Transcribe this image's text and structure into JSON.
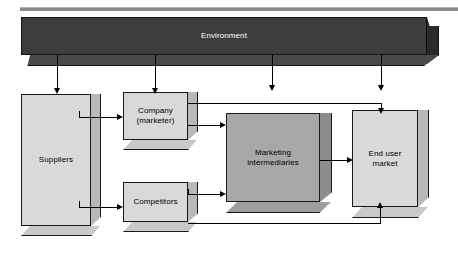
{
  "diagram": {
    "title_label": "Environment",
    "nodes": [
      {
        "id": "environment",
        "label": "Environment",
        "shade": "dark",
        "text_color": "#ffffff"
      },
      {
        "id": "suppliers",
        "label": "Suppliers",
        "shade": "light",
        "text_color": "#000000"
      },
      {
        "id": "company",
        "label": "Company\n(marketer)",
        "shade": "light",
        "text_color": "#000000"
      },
      {
        "id": "competitors",
        "label": "Competitors",
        "shade": "light",
        "text_color": "#000000"
      },
      {
        "id": "marketing_intermediaries",
        "label": "Marketing\nintermediaries",
        "shade": "medium",
        "text_color": "#000000"
      },
      {
        "id": "end_user_market",
        "label": "End user\nmarket",
        "shade": "light",
        "text_color": "#000000"
      }
    ],
    "edges": [
      {
        "from": "environment",
        "to": "suppliers",
        "direction": "down"
      },
      {
        "from": "environment",
        "to": "company",
        "direction": "down"
      },
      {
        "from": "environment",
        "to": "marketing_intermediaries",
        "direction": "down"
      },
      {
        "from": "environment",
        "to": "end_user_market",
        "direction": "down"
      },
      {
        "from": "suppliers",
        "to": "company",
        "direction": "right"
      },
      {
        "from": "suppliers",
        "to": "competitors",
        "direction": "right"
      },
      {
        "from": "company",
        "to": "marketing_intermediaries",
        "direction": "right"
      },
      {
        "from": "company",
        "to": "end_user_market",
        "direction": "right-down"
      },
      {
        "from": "competitors",
        "to": "marketing_intermediaries",
        "direction": "right"
      },
      {
        "from": "competitors",
        "to": "end_user_market",
        "direction": "right-up"
      },
      {
        "from": "marketing_intermediaries",
        "to": "end_user_market",
        "direction": "right"
      }
    ],
    "palette": {
      "background": "#ffffff",
      "light_box": "#d9d9d9",
      "light_box_side": "#b8b8b8",
      "medium_box": "#a8a8a8",
      "medium_box_side": "#8c8c8c",
      "dark_box": "#3d3d3d",
      "dark_box_side": "#2a2a2a",
      "outline": "#1a1a1a",
      "connector": "#000000",
      "rule": "#8c8c8c"
    }
  }
}
